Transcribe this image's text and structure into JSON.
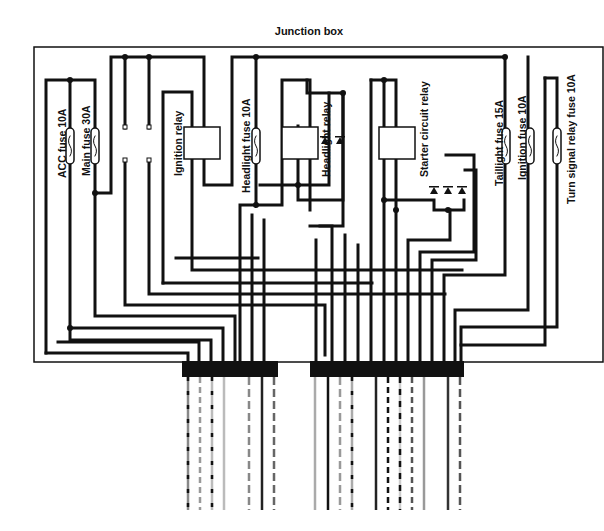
{
  "title": "Junction box",
  "labels": {
    "acc_fuse": "ACC fuse 10A",
    "main_fuse": "Main fuse 30A",
    "ignition_relay": "Ignition relay",
    "headlight_fuse": "Headlight fuse 10A",
    "headlight_relay": "Headlight relay",
    "starter_relay": "Starter circuit relay",
    "taillight_fuse": "Taillight fuse 15A",
    "ignition_fuse": "Ignition fuse 10A",
    "turn_signal_fuse": "Turn signal relay fuse 10A"
  },
  "components": {
    "fuses": [
      "ACC fuse 10A",
      "Main fuse 30A",
      "Headlight fuse 10A",
      "Taillight fuse 15A",
      "Ignition fuse 10A",
      "Turn signal relay fuse 10A"
    ],
    "relays": [
      "Ignition relay",
      "Headlight relay",
      "Starter circuit relay"
    ],
    "diodes": 5,
    "connectors": 2
  },
  "colors": {
    "wire": "#111111",
    "background": "#ffffff"
  }
}
